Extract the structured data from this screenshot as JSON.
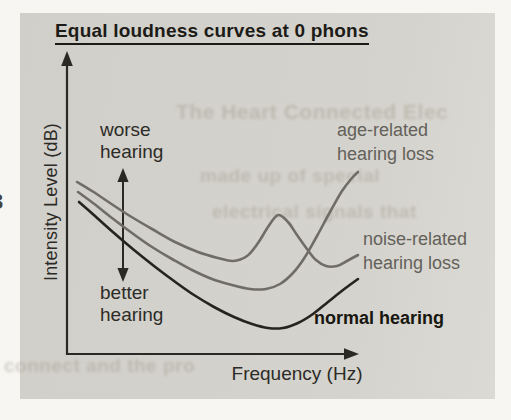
{
  "page": {
    "panel_color": "#d4d2cc",
    "background_color": "#f7f6f2",
    "margin_glyph": "3"
  },
  "chart_data": {
    "type": "line",
    "title": "Equal loudness curves at 0 phons",
    "xlabel": "Frequency (Hz)",
    "ylabel": "Intensity Level (dB)",
    "axis_numeric_ticks": false,
    "grid": false,
    "axis_color": "#2a2926",
    "annotations": {
      "worse": {
        "line1": "worse",
        "line2": "hearing"
      },
      "better": {
        "line1": "better",
        "line2": "hearing"
      },
      "direction_meaning": "vertical double arrow: up = worse hearing, down = better hearing"
    },
    "series": [
      {
        "name": "age-related hearing loss",
        "label_lines": [
          "age-related",
          "hearing loss"
        ],
        "color": "#6f6d66",
        "shape": "descends from upper left to a broad minimum then rises steeply at high frequency",
        "points_px": [
          [
            78,
            192
          ],
          [
            93,
            203
          ],
          [
            112,
            218
          ],
          [
            132,
            233
          ],
          [
            152,
            247
          ],
          [
            172,
            259
          ],
          [
            192,
            270
          ],
          [
            212,
            279
          ],
          [
            232,
            285
          ],
          [
            250,
            289
          ],
          [
            266,
            289
          ],
          [
            280,
            284
          ],
          [
            293,
            273
          ],
          [
            305,
            257
          ],
          [
            317,
            236
          ],
          [
            330,
            212
          ],
          [
            342,
            191
          ],
          [
            352,
            178
          ],
          [
            358,
            172
          ]
        ]
      },
      {
        "name": "noise-related hearing loss",
        "label_lines": [
          "noise-related",
          "hearing loss"
        ],
        "color": "#6f6d66",
        "shape": "descends from upper left, bump (notch of worse hearing) near mid-high frequency, then small dip and slight rise",
        "points_px": [
          [
            77,
            182
          ],
          [
            92,
            191
          ],
          [
            110,
            203
          ],
          [
            130,
            216
          ],
          [
            152,
            229
          ],
          [
            175,
            242
          ],
          [
            198,
            252
          ],
          [
            218,
            258
          ],
          [
            233,
            261
          ],
          [
            247,
            256
          ],
          [
            258,
            243
          ],
          [
            268,
            227
          ],
          [
            278,
            215
          ],
          [
            288,
            222
          ],
          [
            297,
            235
          ],
          [
            307,
            249
          ],
          [
            316,
            260
          ],
          [
            326,
            266
          ],
          [
            337,
            266
          ],
          [
            347,
            261
          ],
          [
            358,
            255
          ]
        ]
      },
      {
        "name": "normal hearing",
        "label_lines": [
          "normal hearing"
        ],
        "color": "#26241f",
        "shape": "U-shaped curve, lowest of the three",
        "points_px": [
          [
            79,
            202
          ],
          [
            95,
            216
          ],
          [
            114,
            233
          ],
          [
            134,
            250
          ],
          [
            154,
            266
          ],
          [
            174,
            281
          ],
          [
            194,
            295
          ],
          [
            214,
            307
          ],
          [
            234,
            317
          ],
          [
            252,
            324
          ],
          [
            268,
            328
          ],
          [
            283,
            328
          ],
          [
            298,
            323
          ],
          [
            313,
            314
          ],
          [
            328,
            302
          ],
          [
            343,
            290
          ],
          [
            358,
            279
          ]
        ]
      }
    ]
  },
  "ghost_bleedthrough": [
    {
      "text": "The Heart Connected Elec",
      "x": 176,
      "y": 100,
      "size": 21
    },
    {
      "text": "made up of special",
      "x": 200,
      "y": 165,
      "size": 19
    },
    {
      "text": "electrical signals that",
      "x": 212,
      "y": 201,
      "size": 19
    },
    {
      "text": "connect and the pro",
      "x": 4,
      "y": 355,
      "size": 19
    }
  ]
}
